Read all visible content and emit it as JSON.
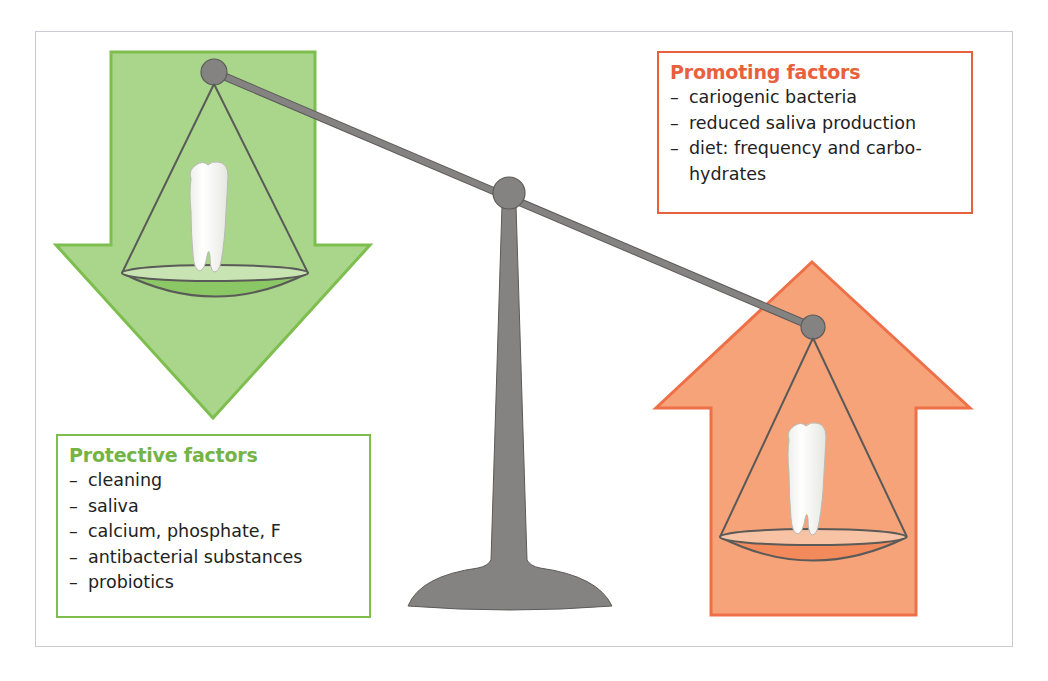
{
  "colors": {
    "protective_accent": "#74b444",
    "protective_fill": "#a9d68a",
    "protective_stroke": "#7dbe4e",
    "promoting_accent": "#e8603c",
    "promoting_fill": "#f6a37a",
    "promoting_stroke": "#ee7048",
    "scale_gray": "#848381",
    "frame_border": "#c9cad4"
  },
  "promoting": {
    "title": "Promoting factors",
    "items": [
      {
        "dash": "–",
        "text": "cariogenic bacteria"
      },
      {
        "dash": "–",
        "text": "reduced saliva production"
      },
      {
        "dash": "–",
        "text": "diet: frequency and carbo-"
      },
      {
        "dash": "",
        "text": "hydrates"
      }
    ]
  },
  "protective": {
    "title": "Protective factors",
    "items": [
      {
        "dash": "–",
        "text": "cleaning"
      },
      {
        "dash": "–",
        "text": "saliva"
      },
      {
        "dash": "–",
        "text": "calcium, phosphate, F"
      },
      {
        "dash": "–",
        "text": "antibacterial substances"
      },
      {
        "dash": "–",
        "text": "probiotics"
      }
    ]
  },
  "illustration": {
    "left_arrow": "down-arrow-icon",
    "right_arrow": "up-arrow-icon",
    "left_pan_content": "tooth-icon",
    "right_pan_content": "tooth-icon",
    "scale": "balance-scale-icon"
  }
}
